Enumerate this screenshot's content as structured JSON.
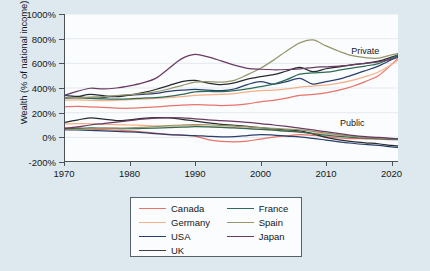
{
  "chart_data": {
    "type": "line",
    "title": "",
    "xlabel": "",
    "ylabel": "Wealth (% of national income)",
    "xlim": [
      1970,
      2021
    ],
    "ylim": [
      -200,
      1000
    ],
    "yticks": [
      "-200%",
      "0%",
      "200%",
      "400%",
      "600%",
      "800%",
      "1000%"
    ],
    "ytick_values": [
      -200,
      0,
      200,
      400,
      600,
      800,
      1000
    ],
    "xticks": [
      "1970",
      "1980",
      "1990",
      "2000",
      "2010",
      "2020"
    ],
    "xtick_values": [
      1970,
      1980,
      1990,
      2000,
      2010,
      2020
    ],
    "grid": "horizontal",
    "legend_position": "below-center",
    "annotations": [
      {
        "text": "Private",
        "x": 2016,
        "y": 700
      },
      {
        "text": "Public",
        "x": 2014,
        "y": 120
      }
    ],
    "x": [
      1970,
      1972,
      1974,
      1976,
      1978,
      1980,
      1982,
      1984,
      1986,
      1988,
      1990,
      1992,
      1994,
      1996,
      1998,
      2000,
      2002,
      2004,
      2006,
      2008,
      2010,
      2012,
      2014,
      2016,
      2018,
      2020,
      2021
    ],
    "groups": [
      {
        "name": "Private",
        "series": [
          {
            "name": "Canada",
            "color": "#e8736a",
            "values": [
              247,
              252,
              247,
              242,
              237,
              236,
              241,
              246,
              255,
              262,
              265,
              262,
              258,
              262,
              272,
              288,
              300,
              318,
              340,
              348,
              360,
              382,
              412,
              452,
              500,
              590,
              640
            ]
          },
          {
            "name": "Germany",
            "color": "#f4b089",
            "values": [
              300,
              303,
              300,
              298,
              300,
              306,
              310,
              315,
              322,
              330,
              340,
              345,
              348,
              355,
              368,
              378,
              382,
              392,
              408,
              416,
              424,
              440,
              462,
              492,
              530,
              590,
              628
            ]
          },
          {
            "name": "USA",
            "color": "#2a3f6e",
            "values": [
              340,
              332,
              318,
              322,
              336,
              342,
              348,
              356,
              372,
              382,
              388,
              382,
              378,
              392,
              428,
              452,
              432,
              452,
              478,
              432,
              452,
              472,
              504,
              540,
              578,
              630,
              660
            ]
          },
          {
            "name": "UK",
            "color": "#262b2e",
            "values": [
              320,
              330,
              348,
              338,
              330,
              342,
              362,
              388,
              420,
              452,
              462,
              440,
              428,
              442,
              472,
              492,
              508,
              538,
              568,
              532,
              556,
              572,
              588,
              600,
              618,
              650,
              668
            ]
          },
          {
            "name": "France",
            "color": "#2e6b55",
            "values": [
              318,
              320,
              316,
              312,
              310,
              312,
              318,
              322,
              332,
              348,
              368,
              372,
              370,
              378,
              392,
              412,
              432,
              468,
              512,
              522,
              528,
              544,
              562,
              578,
              598,
              642,
              668
            ]
          },
          {
            "name": "Spain",
            "color": "#97966a",
            "values": [
              320,
              322,
              326,
              330,
              338,
              346,
              356,
              368,
              392,
              420,
              448,
              452,
              448,
              462,
              508,
              560,
              626,
              700,
              766,
              790,
              742,
              698,
              662,
              646,
              642,
              668,
              680
            ]
          },
          {
            "name": "Japan",
            "color": "#6b3a62",
            "values": [
              340,
              372,
              398,
              392,
              400,
              418,
              442,
              478,
              558,
              638,
              672,
              652,
              620,
              586,
              560,
              552,
              548,
              550,
              556,
              566,
              572,
              578,
              588,
              600,
              612,
              632,
              648
            ]
          }
        ]
      },
      {
        "name": "Public",
        "series": [
          {
            "name": "Canada",
            "color": "#e8736a",
            "values": [
              78,
              76,
              68,
              62,
              58,
              52,
              44,
              34,
              24,
              18,
              10,
              -18,
              -32,
              -36,
              -30,
              -14,
              2,
              12,
              22,
              16,
              6,
              -4,
              -10,
              -12,
              -14,
              -18,
              -16
            ]
          },
          {
            "name": "Germany",
            "color": "#f4b089",
            "values": [
              108,
              112,
              110,
              106,
              104,
              100,
              96,
              92,
              90,
              92,
              96,
              88,
              82,
              78,
              72,
              66,
              58,
              48,
              40,
              36,
              28,
              18,
              8,
              0,
              -4,
              -10,
              -12
            ]
          },
          {
            "name": "USA",
            "color": "#2a3f6e",
            "values": [
              62,
              60,
              56,
              52,
              48,
              44,
              38,
              30,
              22,
              18,
              14,
              8,
              4,
              6,
              14,
              22,
              18,
              10,
              4,
              -8,
              -22,
              -36,
              -48,
              -58,
              -66,
              -78,
              -82
            ]
          },
          {
            "name": "UK",
            "color": "#262b2e",
            "values": [
              120,
              140,
              158,
              148,
              136,
              142,
              154,
              160,
              158,
              146,
              132,
              118,
              106,
              98,
              88,
              78,
              68,
              60,
              52,
              28,
              0,
              -20,
              -34,
              -44,
              -52,
              -66,
              -70
            ]
          },
          {
            "name": "France",
            "color": "#2e6b55",
            "values": [
              68,
              72,
              76,
              74,
              72,
              70,
              72,
              74,
              78,
              82,
              86,
              84,
              80,
              76,
              70,
              64,
              58,
              50,
              42,
              30,
              18,
              8,
              0,
              -6,
              -10,
              -16,
              -18
            ]
          },
          {
            "name": "Spain",
            "color": "#97966a",
            "values": [
              60,
              64,
              70,
              72,
              74,
              76,
              80,
              86,
              94,
              100,
              104,
              102,
              96,
              90,
              84,
              78,
              72,
              66,
              60,
              48,
              34,
              20,
              8,
              0,
              -4,
              -10,
              -12
            ]
          },
          {
            "name": "Japan",
            "color": "#6b3a62",
            "values": [
              70,
              84,
              100,
              112,
              124,
              136,
              148,
              156,
              160,
              158,
              150,
              142,
              136,
              130,
              122,
              112,
              100,
              88,
              74,
              60,
              46,
              30,
              16,
              6,
              0,
              -8,
              -12
            ]
          }
        ]
      }
    ]
  },
  "legend": {
    "columns": [
      {
        "items": [
          {
            "label": "Canada",
            "color": "#e8736a"
          },
          {
            "label": "Germany",
            "color": "#f4b089"
          },
          {
            "label": "USA",
            "color": "#2a3f6e"
          },
          {
            "label": "UK",
            "color": "#3a4247"
          }
        ]
      },
      {
        "items": [
          {
            "label": "France",
            "color": "#2e6b55"
          },
          {
            "label": "Spain",
            "color": "#97966a"
          },
          {
            "label": "Japan",
            "color": "#6b3a62"
          }
        ]
      }
    ]
  },
  "colors": {
    "background": "#dde9ef",
    "plot_background": "#fafcfd",
    "axis": "#4a5258",
    "grid": "#e3eaee",
    "text": "#14181c"
  }
}
